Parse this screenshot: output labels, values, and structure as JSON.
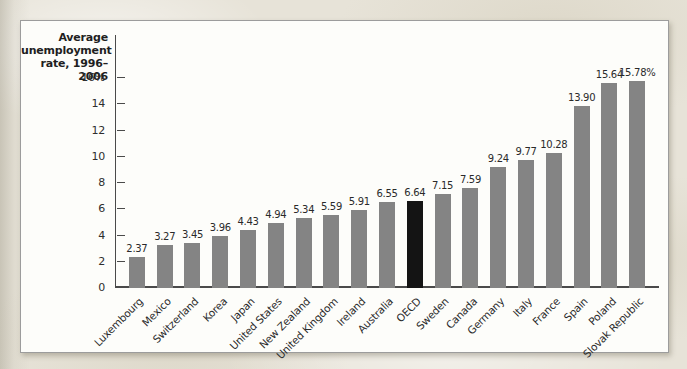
{
  "page": {
    "background_color": "#e7e3d8",
    "panel_background": "#fdfdfa",
    "panel_border_color": "#9c9c9c"
  },
  "chart_data": {
    "type": "bar",
    "title": "Average unemployment rate, 1996–2006",
    "axis_label_lines": [
      "Average",
      "unemployment",
      "rate, 1996–2006"
    ],
    "categories": [
      "Luxembourg",
      "Mexico",
      "Switzerland",
      "Korea",
      "Japan",
      "United States",
      "New Zealand",
      "United Kingdom",
      "Ireland",
      "Australia",
      "OECD",
      "Sweden",
      "Canada",
      "Germany",
      "Italy",
      "France",
      "Spain",
      "Poland",
      "Slovak Republic"
    ],
    "values": [
      2.37,
      3.27,
      3.45,
      3.96,
      4.43,
      4.94,
      5.34,
      5.59,
      5.91,
      6.55,
      6.64,
      7.15,
      7.59,
      9.24,
      9.77,
      10.28,
      13.9,
      15.64,
      15.78
    ],
    "value_labels": [
      "2.37",
      "3.27",
      "3.45",
      "3.96",
      "4.43",
      "4.94",
      "5.34",
      "5.59",
      "5.91",
      "6.55",
      "6.64",
      "7.15",
      "7.59",
      "9.24",
      "9.77",
      "10.28",
      "13.90",
      "15.64",
      "15.78%"
    ],
    "highlight_category": "OECD",
    "bar_color": "#848484",
    "highlight_bar_color": "#141414",
    "xlabel": "",
    "ylabel": "Average unemployment rate, 1996–2006",
    "ylim": [
      0,
      16
    ],
    "yticks": [
      0,
      2,
      4,
      6,
      8,
      10,
      12,
      14,
      16
    ],
    "ytick_labels": [
      "0",
      "2",
      "4",
      "6",
      "8",
      "10",
      "12",
      "14",
      "16%"
    ],
    "grid": false,
    "legend": "none"
  }
}
